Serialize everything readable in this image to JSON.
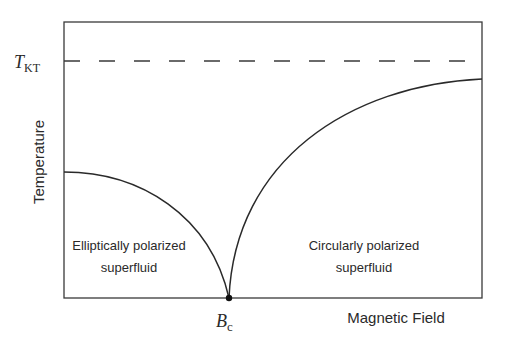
{
  "diagram": {
    "axes": {
      "ylabel": "Temperature",
      "xlabel": "Magnetic Field"
    },
    "markers": {
      "t_kt": {
        "main": "T",
        "sub": "KT",
        "style": "dashed horizontal line"
      },
      "b_c": {
        "main": "B",
        "sub": "c",
        "style": "point on x-axis"
      }
    },
    "regions": [
      {
        "line1": "Elliptically polarized",
        "line2": "superfluid"
      },
      {
        "line1": "Circularly polarized",
        "line2": "superfluid"
      }
    ],
    "colors": {
      "line": "#2a2a2a",
      "background": "#ffffff"
    }
  }
}
